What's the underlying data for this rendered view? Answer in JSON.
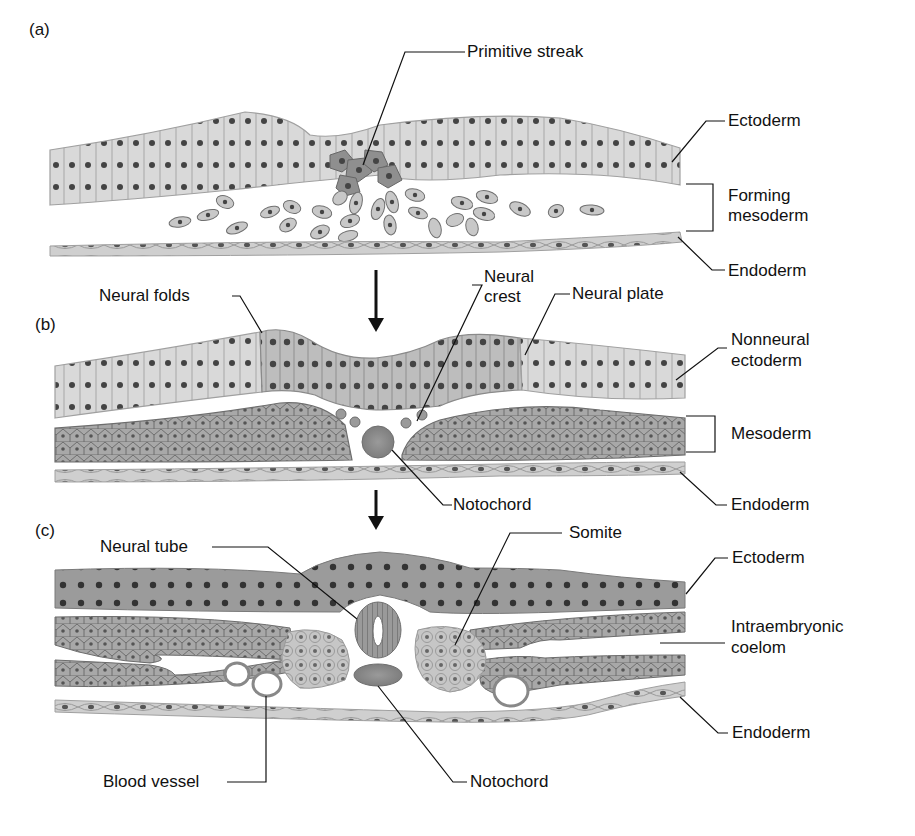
{
  "figure": {
    "panels": [
      {
        "id": "a",
        "tag": "(a)",
        "labels": {
          "primitive_streak": "Primitive streak",
          "ectoderm": "Ectoderm",
          "forming_mesoderm_line1": "Forming",
          "forming_mesoderm_line2": "mesoderm",
          "endoderm": "Endoderm"
        }
      },
      {
        "id": "b",
        "tag": "(b)",
        "labels": {
          "neural_folds": "Neural folds",
          "neural_crest_line1": "Neural",
          "neural_crest_line2": "crest",
          "neural_plate": "Neural plate",
          "nonneural_ectoderm_line1": "Nonneural",
          "nonneural_ectoderm_line2": "ectoderm",
          "mesoderm": "Mesoderm",
          "notochord": "Notochord",
          "endoderm": "Endoderm"
        }
      },
      {
        "id": "c",
        "tag": "(c)",
        "labels": {
          "neural_tube": "Neural tube",
          "somite": "Somite",
          "ectoderm": "Ectoderm",
          "intraembryonic_coelom_line1": "Intraembryonic",
          "intraembryonic_coelom_line2": "coelom",
          "endoderm": "Endoderm",
          "blood_vessel": "Blood vessel",
          "notochord": "Notochord"
        }
      }
    ],
    "colors": {
      "ectoderm_light": "#d9d9d9",
      "ectoderm_dark": "#9b9b9b",
      "neural_plate": "#bdbdbd",
      "mesoderm": "#a8a8a8",
      "somite": "#c6c6c6",
      "endoderm": "#cfcfcf",
      "nucleus": "#444444",
      "outline": "#8a8a8a",
      "notochord": "#8e8e8e",
      "leader_line": "#111111"
    }
  }
}
